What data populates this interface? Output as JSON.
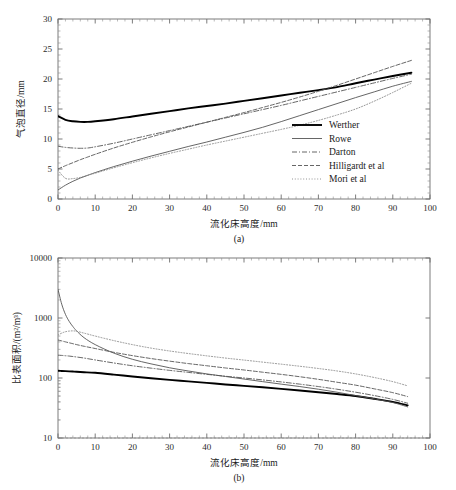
{
  "figure": {
    "panels": [
      {
        "key": "a",
        "caption": "(a)",
        "xlabel": "流化床高度/mm",
        "ylabel": "气泡直径/mm"
      },
      {
        "key": "b",
        "caption": "(b)",
        "xlabel": "流化床高度/mm",
        "ylabel": "比表面积/(m²/m³)"
      }
    ]
  },
  "series_styles": [
    {
      "name": "Werther",
      "color": "#000000",
      "width": 1.9,
      "dash": "none"
    },
    {
      "name": "Rowe",
      "color": "#555555",
      "width": 0.9,
      "dash": "none"
    },
    {
      "name": "Darton",
      "color": "#555555",
      "width": 0.9,
      "dash": "dashdot"
    },
    {
      "name": "Hilligardt et al",
      "color": "#555555",
      "width": 0.9,
      "dash": "dashed"
    },
    {
      "name": "Mori et al",
      "color": "#888888",
      "width": 0.9,
      "dash": "dotted"
    }
  ],
  "chart_data": [
    {
      "type": "line",
      "panel": "a",
      "title": "",
      "xlabel": "流化床高度/mm",
      "ylabel": "气泡直径/mm",
      "xlim": [
        0,
        100
      ],
      "ylim": [
        0,
        30
      ],
      "xticks": [
        0,
        10,
        20,
        30,
        40,
        50,
        60,
        70,
        80,
        90,
        100
      ],
      "yticks": [
        0,
        5,
        10,
        15,
        20,
        25,
        30
      ],
      "yscale": "linear",
      "grid": false,
      "legend_position": "right-middle",
      "legend": [
        "Werther",
        "Rowe",
        "Darton",
        "Hilligardt et al",
        "Mori et al"
      ],
      "x": [
        0,
        2,
        4,
        6,
        8,
        10,
        15,
        20,
        25,
        30,
        35,
        40,
        45,
        50,
        55,
        60,
        65,
        70,
        75,
        80,
        85,
        90,
        95
      ],
      "series": [
        {
          "name": "Werther",
          "values": [
            13.8,
            13.2,
            12.95,
            12.85,
            12.85,
            12.95,
            13.3,
            13.75,
            14.2,
            14.65,
            15.1,
            15.5,
            15.9,
            16.35,
            16.8,
            17.25,
            17.7,
            18.15,
            18.65,
            19.3,
            19.9,
            20.5,
            21.05
          ]
        },
        {
          "name": "Rowe",
          "values": [
            1.5,
            2.3,
            2.95,
            3.5,
            3.95,
            4.4,
            5.4,
            6.3,
            7.15,
            7.95,
            8.75,
            9.5,
            10.3,
            11.1,
            11.95,
            12.9,
            13.9,
            14.9,
            15.9,
            16.9,
            17.85,
            18.8,
            19.6
          ]
        },
        {
          "name": "Darton",
          "values": [
            8.8,
            8.6,
            8.5,
            8.45,
            8.5,
            8.7,
            9.3,
            10.0,
            10.7,
            11.4,
            12.1,
            12.8,
            13.5,
            14.2,
            14.9,
            15.6,
            16.35,
            17.1,
            17.85,
            18.6,
            19.35,
            20.1,
            20.8
          ]
        },
        {
          "name": "Hilligardt et al",
          "values": [
            5.0,
            5.55,
            6.05,
            6.55,
            7.0,
            7.45,
            8.5,
            9.45,
            10.35,
            11.2,
            12.0,
            12.8,
            13.6,
            14.4,
            15.25,
            16.1,
            17.0,
            17.95,
            18.95,
            20.0,
            21.05,
            22.1,
            23.1
          ]
        },
        {
          "name": "Mori et al",
          "values": [
            4.8,
            3.45,
            3.4,
            3.6,
            3.95,
            4.3,
            5.2,
            6.05,
            6.85,
            7.6,
            8.3,
            9.0,
            9.65,
            10.3,
            10.95,
            11.6,
            12.3,
            13.1,
            14.0,
            15.0,
            16.3,
            17.75,
            19.3
          ]
        }
      ]
    },
    {
      "type": "line",
      "panel": "b",
      "title": "",
      "xlabel": "流化床高度/mm",
      "ylabel": "比表面积/(m²/m³)",
      "xlim": [
        0,
        100
      ],
      "ylim": [
        10,
        10000
      ],
      "xticks": [
        0,
        10,
        20,
        30,
        40,
        50,
        60,
        70,
        80,
        90,
        100
      ],
      "yticks": [
        10,
        100,
        1000,
        10000
      ],
      "yscale": "log",
      "grid": false,
      "legend_position": "right-top",
      "legend": [
        "Werther",
        "Rowe",
        "Darton",
        "Hilligardt et al",
        "Mori et al"
      ],
      "x": [
        0,
        1,
        2,
        3,
        4,
        5,
        7,
        10,
        15,
        20,
        25,
        30,
        35,
        40,
        45,
        50,
        55,
        60,
        65,
        70,
        75,
        80,
        85,
        90,
        94
      ],
      "series": [
        {
          "name": "Werther",
          "values": [
            132,
            131,
            130,
            129,
            128,
            127,
            125,
            122,
            114,
            106,
            99,
            93,
            88,
            83,
            78,
            74,
            70,
            66,
            62,
            58,
            54,
            50,
            45,
            40,
            35
          ]
        },
        {
          "name": "Rowe",
          "values": [
            3000,
            1700,
            1150,
            880,
            720,
            610,
            470,
            360,
            260,
            205,
            172,
            148,
            131,
            117,
            106,
            96,
            87,
            79,
            72,
            65,
            58,
            51,
            45,
            39,
            33
          ]
        },
        {
          "name": "Darton",
          "values": [
            240,
            238,
            235,
            232,
            228,
            224,
            215,
            200,
            178,
            160,
            146,
            134,
            124,
            115,
            107,
            100,
            93,
            86,
            79,
            72,
            65,
            58,
            51,
            44,
            38
          ]
        },
        {
          "name": "Hilligardt et al",
          "values": [
            430,
            415,
            400,
            386,
            373,
            360,
            338,
            310,
            268,
            236,
            211,
            191,
            174,
            160,
            147,
            136,
            125,
            115,
            105,
            95,
            85,
            76,
            66,
            57,
            49
          ]
        },
        {
          "name": "Mori et al",
          "values": [
            520,
            560,
            590,
            605,
            610,
            600,
            560,
            500,
            420,
            360,
            315,
            282,
            256,
            234,
            215,
            199,
            184,
            170,
            157,
            144,
            131,
            117,
            102,
            87,
            74
          ]
        }
      ]
    }
  ]
}
